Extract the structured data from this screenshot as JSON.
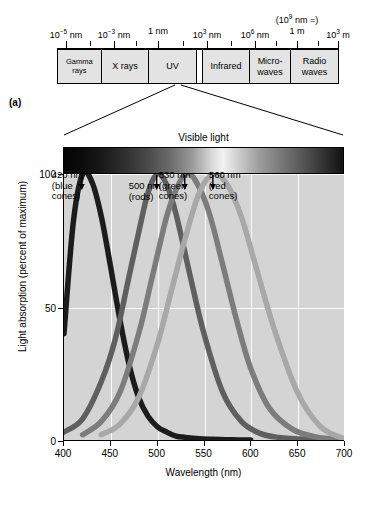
{
  "panels": {
    "a_label": "(a)",
    "b_label": "(b)"
  },
  "em_spectrum": {
    "tick_labels": [
      {
        "text": "10−5 nm",
        "base": "10",
        "exp": "−5",
        "unit": " nm",
        "x": 66
      },
      {
        "text": "10−3 nm",
        "base": "10",
        "exp": "−3",
        "unit": " nm",
        "x": 114
      },
      {
        "text": "1 nm",
        "base": "1",
        "exp": "",
        "unit": " nm",
        "x": 158
      },
      {
        "text": "103 nm",
        "base": "10",
        "exp": "3",
        "unit": " nm",
        "x": 207
      },
      {
        "text": "106 nm",
        "base": "10",
        "exp": "6",
        "unit": " nm",
        "x": 255
      },
      {
        "text": "1 m",
        "base": "1",
        "exp": "",
        "unit": " m",
        "x": 297
      },
      {
        "text": "103 m",
        "base": "10",
        "exp": "3",
        "unit": " m",
        "x": 338
      }
    ],
    "paren_note": {
      "base": "(10",
      "exp": "9",
      "tail": " nm =)",
      "x": 297
    },
    "bands": [
      {
        "name": "Gamma rays",
        "label": "Gamma\nrays",
        "width_pct": 15.6,
        "tiny": true
      },
      {
        "name": "X rays",
        "label": "X rays",
        "width_pct": 17.0,
        "tiny": false
      },
      {
        "name": "UV",
        "label": "UV",
        "width_pct": 17.0,
        "tiny": false
      },
      {
        "name": "Visible light",
        "label": "",
        "width_pct": 2.1,
        "tiny": false
      },
      {
        "name": "Infrared",
        "label": "Infrared",
        "width_pct": 17.0,
        "tiny": false
      },
      {
        "name": "Microwaves",
        "label": "Micro-\nwaves",
        "width_pct": 14.5,
        "tiny": false
      },
      {
        "name": "Radio waves",
        "label": "Radio waves",
        "width_pct": 16.8,
        "tiny": false
      }
    ]
  },
  "visible_light": {
    "title": "Visible light"
  },
  "chart_data": {
    "type": "line",
    "xlabel": "Wavelength (nm)",
    "ylabel": "Light absorption (percent of maximum)",
    "xlim": [
      400,
      700
    ],
    "ylim": [
      0,
      100
    ],
    "xticks": [
      400,
      450,
      500,
      550,
      600,
      650,
      700
    ],
    "yticks": [
      0,
      50,
      100
    ],
    "grid": true,
    "legend_position": "none",
    "series": [
      {
        "name": "blue cones",
        "peak_nm": 420,
        "annotation": "420 nm\n(blue\ncones)",
        "color": "#1c1c1c",
        "x": [
          400,
          410,
          420,
          430,
          440,
          450,
          460,
          470,
          480,
          490,
          500,
          510,
          520,
          530,
          545,
          560,
          580,
          600
        ],
        "y": [
          40,
          82,
          100,
          97,
          84,
          65,
          45,
          28,
          16,
          9,
          5,
          3,
          1.5,
          1,
          0.5,
          0.3,
          0.1,
          0
        ]
      },
      {
        "name": "rods",
        "peak_nm": 500,
        "annotation": "500 nm\n(rods)",
        "color": "#5f5f5f",
        "x": [
          400,
          420,
          440,
          455,
          470,
          480,
          490,
          500,
          510,
          520,
          535,
          550,
          570,
          590,
          610,
          630,
          660,
          700
        ],
        "y": [
          3,
          8,
          22,
          38,
          62,
          78,
          93,
          100,
          96,
          85,
          62,
          40,
          18,
          7,
          2.5,
          1,
          0.3,
          0
        ]
      },
      {
        "name": "green cones",
        "peak_nm": 530,
        "annotation": "530 nm\n(green\ncones)",
        "color": "#7c7c7c",
        "x": [
          420,
          440,
          460,
          480,
          495,
          510,
          520,
          530,
          540,
          555,
          570,
          585,
          600,
          620,
          645,
          670,
          700
        ],
        "y": [
          2,
          7,
          18,
          40,
          62,
          84,
          94,
          100,
          98,
          86,
          66,
          45,
          27,
          12,
          4,
          1.2,
          0
        ]
      },
      {
        "name": "red cones",
        "peak_nm": 560,
        "annotation": "560 nm\n(red\ncones)",
        "color": "#a8a8a8",
        "x": [
          440,
          460,
          480,
          500,
          515,
          530,
          545,
          560,
          575,
          590,
          605,
          625,
          650,
          675,
          700
        ],
        "y": [
          2,
          6,
          16,
          36,
          56,
          76,
          93,
          100,
          96,
          84,
          66,
          42,
          18,
          5,
          0.5
        ]
      }
    ]
  }
}
